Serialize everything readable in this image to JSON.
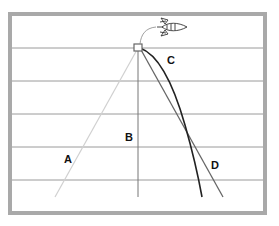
{
  "diagram": {
    "title": "",
    "frame": {
      "x": 8,
      "y": 12,
      "width": 259,
      "height": 203,
      "border_color": "#a9a9a9",
      "border_width": 4
    },
    "gridlines": {
      "color": "#9a9a9a",
      "y": [
        48,
        81,
        114,
        147,
        180
      ]
    },
    "origin": {
      "x": 138,
      "y": 47,
      "box_color": "#666666"
    },
    "rocket": {
      "icon": "rocket-icon",
      "x": 170,
      "y": 24
    },
    "paths": [
      {
        "id": "A",
        "label": "A",
        "color": "#d0d0d0",
        "type": "straight",
        "end": [
          55,
          197
        ]
      },
      {
        "id": "B",
        "label": "B",
        "color": "#777777",
        "type": "straight",
        "end": [
          138,
          197
        ]
      },
      {
        "id": "C",
        "label": "C",
        "color": "#222222",
        "type": "curved",
        "end": [
          202,
          197
        ]
      },
      {
        "id": "D",
        "label": "D",
        "color": "#666666",
        "type": "straight",
        "end": [
          223,
          197
        ]
      }
    ],
    "labels": {
      "A": {
        "text": "A",
        "x": 64,
        "y": 163
      },
      "B": {
        "text": "B",
        "x": 125,
        "y": 141
      },
      "C": {
        "text": "C",
        "x": 167,
        "y": 64
      },
      "D": {
        "text": "D",
        "x": 211,
        "y": 169
      }
    }
  }
}
